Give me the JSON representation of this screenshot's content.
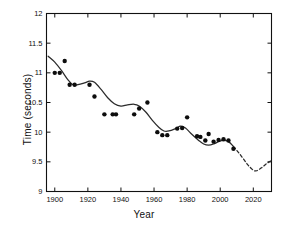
{
  "chart_data": {
    "type": "scatter",
    "title": "",
    "xlabel": "Year",
    "ylabel": "Time (seconds)",
    "xlim": [
      1895,
      2031
    ],
    "ylim": [
      9,
      12
    ],
    "xticks": [
      1900,
      1920,
      1940,
      1960,
      1980,
      2000,
      2020
    ],
    "yticks": [
      9,
      9.5,
      10,
      10.5,
      11,
      11.5,
      12
    ],
    "xtick_labels": [
      "1900",
      "1920",
      "1940",
      "1960",
      "1980",
      "2000",
      "2020"
    ],
    "ytick_labels": [
      "9",
      "9.5",
      "10",
      "10.5",
      "11",
      "11.5",
      "12"
    ],
    "grid": false,
    "legend": null,
    "series": [
      {
        "name": "Record times",
        "type": "scatter",
        "marker": "filled-circle",
        "color": "#0d0d0d",
        "points": [
          {
            "x": 1900,
            "y": 11.0
          },
          {
            "x": 1903,
            "y": 11.0
          },
          {
            "x": 1906,
            "y": 11.2
          },
          {
            "x": 1909,
            "y": 10.8
          },
          {
            "x": 1912,
            "y": 10.8
          },
          {
            "x": 1921,
            "y": 10.8
          },
          {
            "x": 1924,
            "y": 10.6
          },
          {
            "x": 1930,
            "y": 10.3
          },
          {
            "x": 1935,
            "y": 10.3
          },
          {
            "x": 1937,
            "y": 10.3
          },
          {
            "x": 1948,
            "y": 10.3
          },
          {
            "x": 1951,
            "y": 10.4
          },
          {
            "x": 1956,
            "y": 10.5
          },
          {
            "x": 1962,
            "y": 10.0
          },
          {
            "x": 1965,
            "y": 9.95
          },
          {
            "x": 1968,
            "y": 9.95
          },
          {
            "x": 1974,
            "y": 10.06
          },
          {
            "x": 1977,
            "y": 10.07
          },
          {
            "x": 1980,
            "y": 10.25
          },
          {
            "x": 1986,
            "y": 9.93
          },
          {
            "x": 1988,
            "y": 9.92
          },
          {
            "x": 1991,
            "y": 9.86
          },
          {
            "x": 1993,
            "y": 9.97
          },
          {
            "x": 1996,
            "y": 9.84
          },
          {
            "x": 1999,
            "y": 9.87
          },
          {
            "x": 2002,
            "y": 9.88
          },
          {
            "x": 2005,
            "y": 9.86
          },
          {
            "x": 2008,
            "y": 9.72
          }
        ]
      },
      {
        "name": "Fitted trend",
        "type": "line",
        "style": "solid",
        "color": "#2b2b2b",
        "points": [
          {
            "x": 1896,
            "y": 11.28
          },
          {
            "x": 1900,
            "y": 11.18
          },
          {
            "x": 1904,
            "y": 11.04
          },
          {
            "x": 1908,
            "y": 10.88
          },
          {
            "x": 1911,
            "y": 10.8
          },
          {
            "x": 1914,
            "y": 10.8
          },
          {
            "x": 1918,
            "y": 10.83
          },
          {
            "x": 1921,
            "y": 10.86
          },
          {
            "x": 1924,
            "y": 10.84
          },
          {
            "x": 1928,
            "y": 10.72
          },
          {
            "x": 1932,
            "y": 10.58
          },
          {
            "x": 1936,
            "y": 10.48
          },
          {
            "x": 1940,
            "y": 10.44
          },
          {
            "x": 1944,
            "y": 10.46
          },
          {
            "x": 1948,
            "y": 10.47
          },
          {
            "x": 1951,
            "y": 10.44
          },
          {
            "x": 1955,
            "y": 10.34
          },
          {
            "x": 1959,
            "y": 10.2
          },
          {
            "x": 1963,
            "y": 10.08
          },
          {
            "x": 1966,
            "y": 10.02
          },
          {
            "x": 1969,
            "y": 10.02
          },
          {
            "x": 1973,
            "y": 10.06
          },
          {
            "x": 1976,
            "y": 10.1
          },
          {
            "x": 1979,
            "y": 10.07
          },
          {
            "x": 1983,
            "y": 9.96
          },
          {
            "x": 1987,
            "y": 9.86
          },
          {
            "x": 1990,
            "y": 9.8
          },
          {
            "x": 1993,
            "y": 9.78
          },
          {
            "x": 1996,
            "y": 9.8
          },
          {
            "x": 1999,
            "y": 9.84
          },
          {
            "x": 2002,
            "y": 9.86
          },
          {
            "x": 2005,
            "y": 9.84
          },
          {
            "x": 2008,
            "y": 9.76
          }
        ]
      },
      {
        "name": "Extrapolation",
        "type": "line",
        "style": "dashed",
        "color": "#2b2b2b",
        "points": [
          {
            "x": 2008,
            "y": 9.76
          },
          {
            "x": 2011,
            "y": 9.66
          },
          {
            "x": 2014,
            "y": 9.55
          },
          {
            "x": 2017,
            "y": 9.44
          },
          {
            "x": 2020,
            "y": 9.36
          },
          {
            "x": 2022,
            "y": 9.35
          },
          {
            "x": 2025,
            "y": 9.4
          },
          {
            "x": 2028,
            "y": 9.47
          },
          {
            "x": 2031,
            "y": 9.52
          }
        ]
      }
    ]
  }
}
